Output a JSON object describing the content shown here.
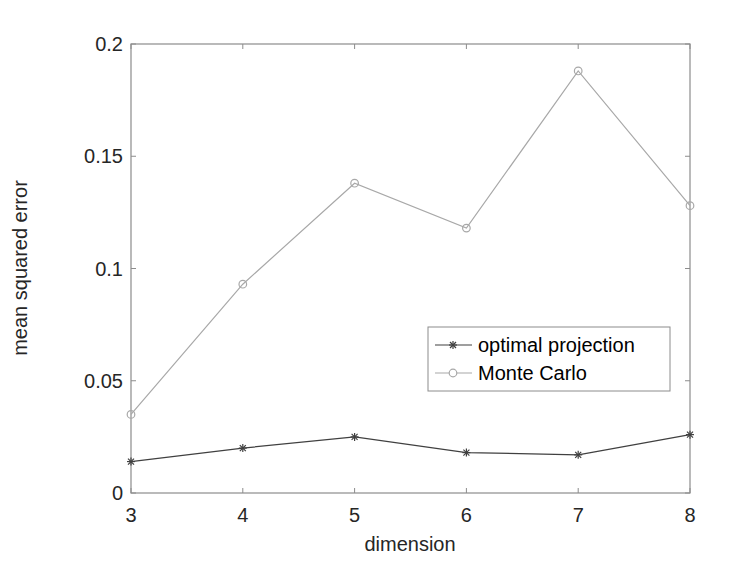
{
  "chart_data": {
    "type": "line",
    "title": "",
    "xlabel": "dimension",
    "ylabel": "mean squared error",
    "x": [
      3,
      4,
      5,
      6,
      7,
      8
    ],
    "xlim": [
      3,
      8
    ],
    "ylim": [
      0,
      0.2
    ],
    "xticks": [
      "3",
      "4",
      "5",
      "6",
      "7",
      "8"
    ],
    "yticks": [
      "0",
      "0.05",
      "0.1",
      "0.15",
      "0.2"
    ],
    "ytick_values": [
      0,
      0.05,
      0.1,
      0.15,
      0.2
    ],
    "grid": false,
    "legend_position": "east (inside, right-middle)",
    "series": [
      {
        "name": "optimal projection",
        "marker": "asterisk",
        "color": "#404040",
        "values": [
          0.014,
          0.02,
          0.025,
          0.018,
          0.017,
          0.026
        ]
      },
      {
        "name": "Monte Carlo",
        "marker": "circle",
        "color": "#a8a8a8",
        "values": [
          0.035,
          0.093,
          0.138,
          0.118,
          0.188,
          0.128
        ]
      }
    ]
  },
  "legend": {
    "items": [
      {
        "label": "optimal projection",
        "marker": "asterisk-icon"
      },
      {
        "label": "Monte Carlo",
        "marker": "circle-icon"
      }
    ]
  },
  "colors": {
    "axis": "#8c8c8c",
    "text": "#262626",
    "legend_border": "#8c8c8c"
  }
}
